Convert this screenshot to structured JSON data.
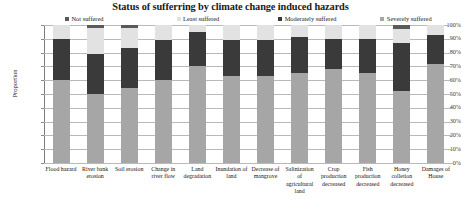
{
  "chart_data": {
    "type": "bar",
    "subtype": "stacked-column-100",
    "title": "Status of sufferring by climate change induced hazards",
    "xlabel": "",
    "ylabel": "Proportion",
    "ylim": [
      0,
      100
    ],
    "ytick_labels": [
      "100%",
      "90%",
      "80%",
      "70%",
      "60%",
      "50%",
      "40%",
      "30%",
      "20%",
      "10%",
      "0%"
    ],
    "grid": true,
    "legend_position": "top",
    "categories": [
      "Flood hazard",
      "River bank erosion",
      "Soil erosion",
      "Change in river flow",
      "Land degradation",
      "Inundation of land",
      "Decrease of mangrove",
      "Salinization of agricultural land",
      "Crop production decreased",
      "Fish production decreased",
      "Honey colletion decreased",
      "Damages of House"
    ],
    "series": [
      {
        "name": "Severely suffered",
        "color": "#a6a6a6",
        "values": [
          60,
          50,
          54,
          60,
          70,
          63,
          63,
          65,
          68,
          65,
          52,
          72
        ]
      },
      {
        "name": "Moderately suffered",
        "color": "#3a3a3a",
        "values": [
          30,
          29,
          29,
          29,
          25,
          26,
          26,
          26,
          22,
          25,
          35,
          21
        ]
      },
      {
        "name": "Least suffered",
        "color": "#e2e2e2",
        "values": [
          10,
          19,
          15,
          11,
          5,
          11,
          11,
          9,
          10,
          10,
          10,
          7
        ]
      },
      {
        "name": "Not suffered",
        "color": "#5a5a5a",
        "values": [
          0,
          2,
          2,
          0,
          0,
          0,
          0,
          0,
          0,
          0,
          3,
          0
        ]
      }
    ]
  },
  "legend": {
    "items": [
      {
        "label": "Not suffered",
        "color": "#5a5a5a"
      },
      {
        "label": "Least suffered",
        "color": "#e2e2e2"
      },
      {
        "label": "Moderately suffered",
        "color": "#3a3a3a"
      },
      {
        "label": "Severely suffered",
        "color": "#a6a6a6"
      }
    ]
  }
}
